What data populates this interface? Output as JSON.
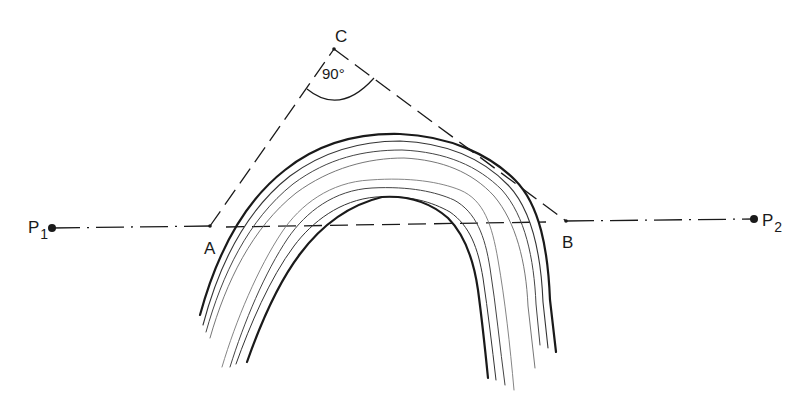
{
  "diagram": {
    "type": "geometric construction over folded layers (anticline)",
    "points": {
      "P1": {
        "label": "P",
        "sub": "1",
        "x": 52,
        "y": 228
      },
      "A": {
        "label": "A",
        "x": 210,
        "y": 226
      },
      "C": {
        "label": "C",
        "x": 334,
        "y": 49
      },
      "B": {
        "label": "B",
        "x": 566,
        "y": 221
      },
      "P2": {
        "label": "P",
        "sub": "2",
        "x": 754,
        "y": 219
      }
    },
    "angle_label": "90°",
    "lines": [
      {
        "from": "P1",
        "to": "A",
        "style": "dash-dot"
      },
      {
        "from": "B",
        "to": "P2",
        "style": "dash-dot"
      },
      {
        "from": "A",
        "to": "C",
        "style": "dashed"
      },
      {
        "from": "C",
        "to": "B",
        "style": "dashed"
      },
      {
        "from": "A",
        "to": "B",
        "style": "dashed"
      }
    ],
    "fold": {
      "description": "Arch-shaped bundle of roughly parallel wavy layer lines; outer and inner bundles with bold boundary lines"
    }
  },
  "colors": {
    "ink": "#1a1a1a",
    "thin": "#555555",
    "background": "#ffffff"
  }
}
